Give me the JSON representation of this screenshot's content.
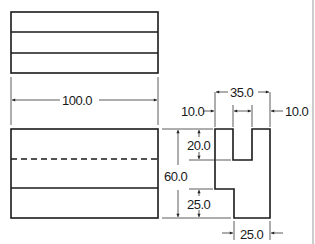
{
  "drawing": {
    "type": "orthographic-projection",
    "views": [
      "top-view",
      "front-view",
      "side-view"
    ],
    "colors": {
      "line": "#1a1a1a",
      "dim": "#333333",
      "frame": "#999999",
      "background": "#ffffff"
    }
  },
  "dimensions": {
    "length": "100.0",
    "height": "60.0",
    "slot_depth": "20.0",
    "step_height": "25.0",
    "width": "35.0",
    "left_wall": "10.0",
    "right_wall": "10.0",
    "base_width": "25.0"
  }
}
